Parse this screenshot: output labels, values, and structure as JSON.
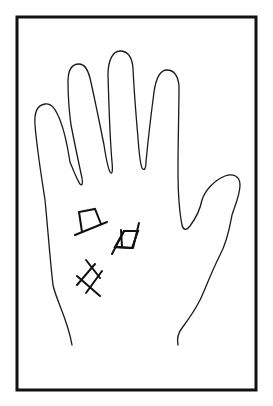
{
  "figure": {
    "type": "palmistry-diagram",
    "colors": {
      "background": "#ffffff",
      "line": "#1a1a1a",
      "frame": "#111111"
    },
    "frame": {
      "x": 17,
      "y": 17,
      "width": 239,
      "height": 373,
      "stroke_width": 3
    },
    "symbols": [
      {
        "name": "square-near-heart-line",
        "shape": "square-with-base-line"
      },
      {
        "name": "parallelogram-on-palm",
        "shape": "slanted-square-with-extended-sides"
      },
      {
        "name": "grille-lower-palm",
        "shape": "cross-hatch-grille"
      }
    ]
  }
}
